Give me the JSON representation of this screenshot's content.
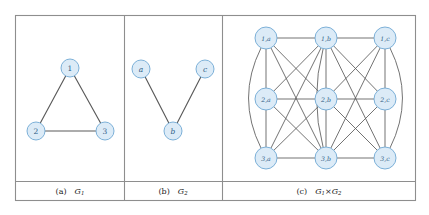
{
  "figure": {
    "background_color": "#ffffff",
    "frame_color": "#8e8e8e",
    "node_fill": "#dcebf7",
    "node_stroke": "#6fa8d4",
    "node_text_color": "#2f5d86",
    "edge_color": "#5a5a5a"
  },
  "panels": [
    {
      "id": "panel-a",
      "caption_tag": "(a)",
      "caption_name": "G",
      "caption_sub": "1",
      "nodes": [
        {
          "id": "n1",
          "label": "1",
          "x": 70,
          "y": 68,
          "r": 9
        },
        {
          "id": "n2",
          "label": "2",
          "x": 36,
          "y": 131,
          "r": 9
        },
        {
          "id": "n3",
          "label": "3",
          "x": 105,
          "y": 131,
          "r": 9
        }
      ],
      "edges": [
        {
          "from": "n1",
          "to": "n2"
        },
        {
          "from": "n1",
          "to": "n3"
        },
        {
          "from": "n2",
          "to": "n3"
        }
      ]
    },
    {
      "id": "panel-b",
      "caption_tag": "(b)",
      "caption_name": "G",
      "caption_sub": "2",
      "nodes": [
        {
          "id": "na",
          "label": "a",
          "x": 141,
          "y": 69,
          "r": 9
        },
        {
          "id": "nc",
          "label": "c",
          "x": 205,
          "y": 69,
          "r": 9
        },
        {
          "id": "nb",
          "label": "b",
          "x": 173,
          "y": 131,
          "r": 9
        }
      ],
      "edges": [
        {
          "from": "na",
          "to": "nb"
        },
        {
          "from": "nc",
          "to": "nb"
        }
      ]
    },
    {
      "id": "panel-c",
      "caption_tag": "(c)",
      "caption_name": "G",
      "caption_sub": "1",
      "caption_op": "×",
      "caption_name2": "G",
      "caption_sub2": "2",
      "nodes": [
        {
          "id": "p1a",
          "label": "1,a",
          "x": 266,
          "y": 38,
          "r": 11
        },
        {
          "id": "p1b",
          "label": "1,b",
          "x": 326,
          "y": 38,
          "r": 11
        },
        {
          "id": "p1c",
          "label": "1,c",
          "x": 385,
          "y": 38,
          "r": 11
        },
        {
          "id": "p2a",
          "label": "2,a",
          "x": 266,
          "y": 99,
          "r": 11
        },
        {
          "id": "p2b",
          "label": "2,b",
          "x": 326,
          "y": 99,
          "r": 11
        },
        {
          "id": "p2c",
          "label": "2,c",
          "x": 385,
          "y": 99,
          "r": 11
        },
        {
          "id": "p3a",
          "label": "3,a",
          "x": 266,
          "y": 158,
          "r": 11
        },
        {
          "id": "p3b",
          "label": "3,b",
          "x": 326,
          "y": 158,
          "r": 11
        },
        {
          "id": "p3c",
          "label": "3,c",
          "x": 385,
          "y": 158,
          "r": 11
        }
      ],
      "edges_straight": [
        {
          "from": "p1a",
          "to": "p1b"
        },
        {
          "from": "p1b",
          "to": "p1c"
        },
        {
          "from": "p2a",
          "to": "p2b"
        },
        {
          "from": "p2b",
          "to": "p2c"
        },
        {
          "from": "p3a",
          "to": "p3b"
        },
        {
          "from": "p3b",
          "to": "p3c"
        },
        {
          "from": "p1a",
          "to": "p2a"
        },
        {
          "from": "p2a",
          "to": "p3a"
        },
        {
          "from": "p1b",
          "to": "p2b"
        },
        {
          "from": "p2b",
          "to": "p3b"
        },
        {
          "from": "p1c",
          "to": "p2c"
        },
        {
          "from": "p2c",
          "to": "p3c"
        },
        {
          "from": "p1a",
          "to": "p2b"
        },
        {
          "from": "p1b",
          "to": "p2a"
        },
        {
          "from": "p1b",
          "to": "p2c"
        },
        {
          "from": "p1c",
          "to": "p2b"
        },
        {
          "from": "p2a",
          "to": "p3b"
        },
        {
          "from": "p2b",
          "to": "p3a"
        },
        {
          "from": "p2b",
          "to": "p3c"
        },
        {
          "from": "p2c",
          "to": "p3b"
        },
        {
          "from": "p1a",
          "to": "p3b"
        },
        {
          "from": "p1b",
          "to": "p3a"
        },
        {
          "from": "p1b",
          "to": "p3c"
        },
        {
          "from": "p1c",
          "to": "p3b"
        },
        {
          "from": "p1a",
          "to": "p3a"
        },
        {
          "from": "p1c",
          "to": "p3c"
        }
      ],
      "edges_curved": [
        {
          "from": "p1a",
          "to": "p3a",
          "bow": -30
        },
        {
          "from": "p1b",
          "to": "p3b",
          "bow": -16
        },
        {
          "from": "p1c",
          "to": "p3c",
          "bow": 30
        }
      ]
    }
  ],
  "frame": {
    "outer": {
      "x": 15,
      "y": 15,
      "width": 401,
      "height": 186
    },
    "dividers_x": [
      124,
      222
    ],
    "caption_rule_y": 181,
    "caption_baseline_y": 191
  }
}
